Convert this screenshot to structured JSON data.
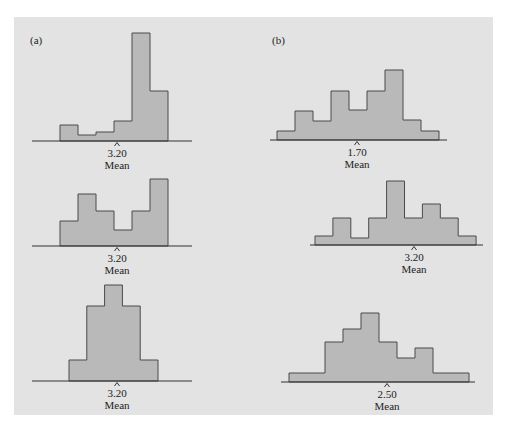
{
  "figure": {
    "panel_labels": [
      "(a)",
      "(b)"
    ],
    "mean_label": "Mean",
    "colors": {
      "background": "#e3e3e3",
      "bar_fill": "#b9b9b9",
      "bar_stroke": "#4a4a4a",
      "axis": "#333333",
      "text": "#222222"
    }
  },
  "chart_data": [
    {
      "type": "bar",
      "panel": "(a)",
      "position": "top",
      "title": "(a)",
      "description": "Left-skewed histogram",
      "bins": 6,
      "values": [
        16,
        6,
        9,
        20,
        108,
        50
      ],
      "mean": 3.2,
      "mean_text": "3.20",
      "xlabel": "Mean",
      "geometry": {
        "x0": 60,
        "bin_w": 18,
        "baseline": 141,
        "axis_x": [
          32,
          192
        ],
        "caret_x": 117,
        "scale": 1
      }
    },
    {
      "type": "bar",
      "panel": "(a)",
      "position": "middle",
      "description": "Bimodal / irregular histogram",
      "bins": 6,
      "values": [
        25,
        52,
        35,
        16,
        35,
        67
      ],
      "mean": 3.2,
      "mean_text": "3.20",
      "xlabel": "Mean",
      "geometry": {
        "x0": 60,
        "bin_w": 18,
        "baseline": 246,
        "axis_x": [
          32,
          192
        ],
        "caret_x": 117,
        "scale": 1
      }
    },
    {
      "type": "bar",
      "panel": "(a)",
      "position": "bottom",
      "description": "Symmetric histogram",
      "bins": 5,
      "values": [
        21,
        75,
        96,
        75,
        21
      ],
      "mean": 3.2,
      "mean_text": "3.20",
      "xlabel": "Mean",
      "geometry": {
        "x0": 69,
        "bin_w": 17.8,
        "baseline": 381,
        "axis_x": [
          32,
          192
        ],
        "caret_x": 117,
        "scale": 1
      }
    },
    {
      "type": "bar",
      "panel": "(b)",
      "position": "top",
      "title": "(b)",
      "description": "Irregular histogram",
      "bins": 9,
      "values": [
        9,
        29,
        19,
        49,
        30,
        49,
        70,
        20,
        9
      ],
      "mean": 1.7,
      "mean_text": "1.70",
      "xlabel": "Mean",
      "geometry": {
        "x0": 277,
        "bin_w": 18,
        "baseline": 140,
        "axis_x": [
          270,
          447
        ],
        "caret_x": 357,
        "scale": 1
      }
    },
    {
      "type": "bar",
      "panel": "(b)",
      "position": "middle",
      "description": "Irregular symmetric-ish histogram",
      "bins": 9,
      "values": [
        9,
        27,
        7,
        27,
        64,
        27,
        41,
        27,
        9
      ],
      "mean": 3.2,
      "mean_text": "3.20",
      "xlabel": "Mean",
      "geometry": {
        "x0": 315,
        "bin_w": 17.9,
        "baseline": 245,
        "axis_x": [
          310,
          483
        ],
        "caret_x": 414,
        "scale": 1
      }
    },
    {
      "type": "bar",
      "panel": "(b)",
      "position": "bottom",
      "description": "Unimodal histogram",
      "bins": 10,
      "values": [
        9,
        9,
        40,
        53,
        69,
        40,
        24,
        34,
        9,
        9
      ],
      "mean": 2.5,
      "mean_text": "2.50",
      "xlabel": "Mean",
      "geometry": {
        "x0": 289,
        "bin_w": 18,
        "baseline": 382,
        "axis_x": [
          281,
          475
        ],
        "caret_x": 387,
        "scale": 1
      }
    }
  ]
}
